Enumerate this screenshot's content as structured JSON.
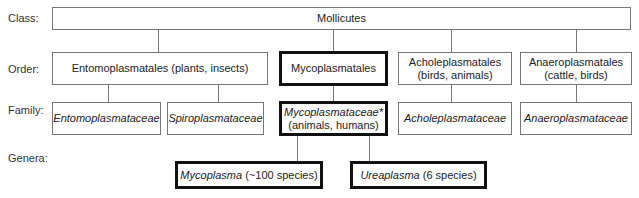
{
  "rank_labels": {
    "class": "Class:",
    "order": "Order:",
    "family": "Family:",
    "genera": "Genera:"
  },
  "class": {
    "name": "Mollicutes"
  },
  "orders": [
    {
      "name": "Entomoplasmatales",
      "hosts": "(plants, insects)",
      "label": "Entomoplasmatales (plants, insects)"
    },
    {
      "name": "Mycoplasmatales",
      "highlighted": true
    },
    {
      "name": "Acholeplasmatales",
      "hosts": "(birds, animals)"
    },
    {
      "name": "Anaeroplasmatales",
      "hosts": "(cattle, birds)"
    }
  ],
  "families": [
    {
      "name": "Entomoplasmataceae"
    },
    {
      "name": "Spiroplasmataceae"
    },
    {
      "name": "Mycoplasmataceae*",
      "hosts": "(animals, humans)",
      "highlighted": true
    },
    {
      "name": "Acholeplasmataceae"
    },
    {
      "name": "Anaeroplasmataceae"
    }
  ],
  "genera": [
    {
      "name": "Mycoplasma",
      "detail": "(~100 species)",
      "highlighted": true
    },
    {
      "name": "Ureaplasma",
      "detail": "(6 species)",
      "highlighted": true
    }
  ]
}
